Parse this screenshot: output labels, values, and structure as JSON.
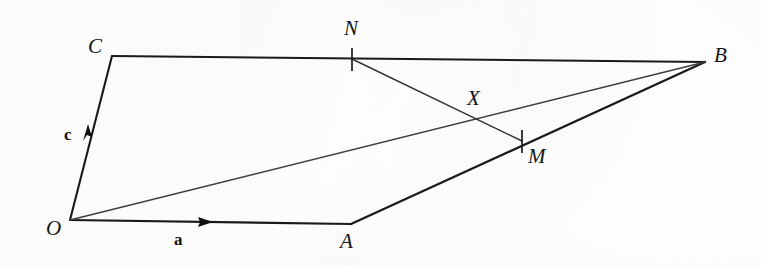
{
  "figure": {
    "background_color": "#ececeb",
    "ink_color": "#1a1a1a",
    "thin_ink_color": "#3d3d3d",
    "width": 761,
    "height": 267
  },
  "vertices": [
    {
      "id": "O",
      "label": "O",
      "x": 70,
      "y": 220,
      "label_x": 46,
      "label_y": 218
    },
    {
      "id": "A",
      "label": "A",
      "x": 351,
      "y": 224,
      "label_x": 340,
      "label_y": 231
    },
    {
      "id": "B",
      "label": "B",
      "x": 705,
      "y": 62,
      "label_x": 714,
      "label_y": 45
    },
    {
      "id": "C",
      "label": "C",
      "x": 112,
      "y": 56,
      "label_x": 88,
      "label_y": 36
    }
  ],
  "marked_points": [
    {
      "id": "N",
      "label": "N",
      "x": 352,
      "y": 59,
      "label_x": 344,
      "label_y": 18,
      "on_segment": "CB",
      "tick": true
    },
    {
      "id": "M",
      "label": "M",
      "x": 522,
      "y": 141,
      "label_x": 528,
      "label_y": 146,
      "on_segment": "AB",
      "tick": true
    },
    {
      "id": "X",
      "label": "X",
      "x": 475,
      "y": 118,
      "label_x": 467,
      "label_y": 88,
      "on_segment": "OB ∩ NM",
      "tick": false
    }
  ],
  "segments": [
    {
      "id": "OC",
      "from": "O",
      "to": "C",
      "weight": "thick",
      "style": "solid"
    },
    {
      "id": "CB",
      "from": "C",
      "to": "B",
      "weight": "thick",
      "style": "solid"
    },
    {
      "id": "OA",
      "from": "O",
      "to": "A",
      "weight": "thick",
      "style": "solid"
    },
    {
      "id": "AB",
      "from": "A",
      "to": "B",
      "weight": "thick",
      "style": "solid"
    },
    {
      "id": "OB",
      "from": "O",
      "to": "B",
      "weight": "thin",
      "style": "solid"
    },
    {
      "id": "NM",
      "from": "N",
      "to": "M",
      "weight": "thin",
      "style": "solid"
    }
  ],
  "vectors": [
    {
      "id": "a",
      "label": "a",
      "along_segment": "OA",
      "arrow_tip_x": 213,
      "arrow_tip_y": 222,
      "label_x": 174,
      "label_y": 231,
      "direction": "right"
    },
    {
      "id": "c",
      "label": "c",
      "along_segment": "OC",
      "arrow_tip_x": 88,
      "arrow_tip_y": 124,
      "label_x": 64,
      "label_y": 126,
      "direction": "up"
    }
  ]
}
